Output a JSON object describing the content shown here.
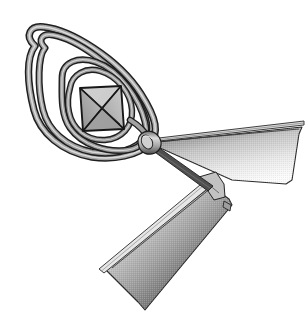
{
  "figure": {
    "background_color": "#ffffff",
    "width": 308,
    "height": 334,
    "alt_text": "Abstract mechanical drawing: a spiral of round tubing wound around a wireframe octahedron, joined at a cylindrical hub to two swept triangular vanes with thin spars"
  },
  "palette": {
    "background": "#ffffff",
    "outline_dark": "#1a1a1a",
    "tube_stroke": "#2b2b2b",
    "tube_fill_light": "#d6d6d6",
    "tube_fill_mid": "#8c8c8c",
    "tube_fill_dark": "#4a4a4a",
    "core_fill_light": "#c9c9c9",
    "core_fill_mid": "#a8a8a8",
    "core_fill_dark": "#8a8a8a",
    "wing_gradient_light": "#f2f2f2",
    "wing_gradient_mid": "#b4b4b4",
    "wing_gradient_dark": "#3c3c3c",
    "hub_fill": "#bdbdbd",
    "spar_stroke": "#303030"
  },
  "parts": [
    {
      "id": "outer-loop",
      "label": "Outer teardrop coil turn",
      "description": "Largest turn of the tube, a rounded triangular teardrop sweeping from upper-left down to the hub"
    },
    {
      "id": "middle-loop",
      "label": "Middle coil turn",
      "description": "Second nested turn of the tube inside the outer teardrop"
    },
    {
      "id": "inner-loop",
      "label": "Inner coil turn",
      "description": "Circular innermost turn of the tube surrounding the core"
    },
    {
      "id": "octahedron-core",
      "label": "Octahedron wireframe core",
      "description": "Square-outline polyhedron with full diagonals and internal facet shading at the spiral centre"
    },
    {
      "id": "hub",
      "label": "Cylindrical hub",
      "description": "Small shaded cylinder where the coil terminates and both vanes attach"
    },
    {
      "id": "upper-wing",
      "label": "Upper right vane",
      "description": "Tapered triangular vane sweeping right from the hub with vertical tonal gradient"
    },
    {
      "id": "upper-spar",
      "label": "Upper leading-edge spar",
      "description": "Thin tapered rod running along the top edge of the upper vane"
    },
    {
      "id": "lower-wing",
      "label": "Lower left vane",
      "description": "Tapered triangular vane sweeping down-left with vertical tonal gradient and dark tip"
    },
    {
      "id": "lower-spar",
      "label": "Lower leading-edge spar",
      "description": "Thin double-line rod running along the upper edge of the lower vane"
    },
    {
      "id": "link-rod",
      "label": "Hub-to-vane link rod",
      "description": "Dark slender rod connecting the hub down to the lower vane bracket"
    },
    {
      "id": "bracket-clip",
      "label": "Vane root bracket clip",
      "description": "Small rectangular tab at the root of the lower vane"
    }
  ]
}
